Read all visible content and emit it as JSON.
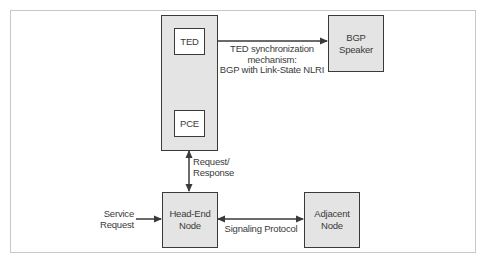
{
  "diagram": {
    "colors": {
      "stroke": "#3a3a3a",
      "box_fill": "#e4e4e4",
      "inner_box_fill": "#ffffff",
      "frame": "#c8c8c8"
    },
    "nodes": {
      "pce_container": {
        "label": ""
      },
      "ted": {
        "label": "TED"
      },
      "pce": {
        "label": "PCE"
      },
      "bgp_speaker": {
        "lines": [
          "BGP",
          "Speaker"
        ]
      },
      "head_end": {
        "lines": [
          "Head-End",
          "Node"
        ]
      },
      "adjacent": {
        "lines": [
          "Adjacent",
          "Node"
        ]
      }
    },
    "edges": {
      "ted_sync": {
        "lines": [
          "TED synchronization",
          "mechanism:",
          "BGP with Link-State NLRI"
        ]
      },
      "request_response": {
        "lines": [
          "Request/",
          "Response"
        ]
      },
      "service_request": {
        "lines": [
          "Service",
          "Request"
        ]
      },
      "signaling": {
        "label": "Signaling Protocol"
      }
    }
  }
}
